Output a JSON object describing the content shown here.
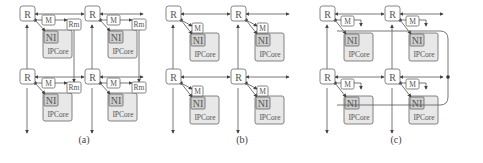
{
  "figure": {
    "panels": [
      {
        "id": "a",
        "caption": "(a)",
        "router_label": "R",
        "mesh": "2x2",
        "nodes": [
          {
            "router": "R",
            "modules": [
              "M",
              "Rm"
            ],
            "ni": "NI",
            "core": "IPCore"
          },
          {
            "router": "R",
            "modules": [
              "M",
              "Rm"
            ],
            "ni": "NI",
            "core": "IPCore"
          },
          {
            "router": "R",
            "modules": [
              "M",
              "Rm"
            ],
            "ni": "NI",
            "core": "IPCore"
          },
          {
            "router": "R",
            "modules": [
              "M",
              "Rm"
            ],
            "ni": "NI",
            "core": "IPCore"
          }
        ]
      },
      {
        "id": "b",
        "caption": "(b)",
        "router_label": "R",
        "mesh": "2x2",
        "nodes": [
          {
            "router": "R",
            "modules": [
              "M"
            ],
            "ni": "NI",
            "core": "IPCore"
          },
          {
            "router": "R",
            "modules": [
              "M"
            ],
            "ni": "NI",
            "core": "IPCore"
          },
          {
            "router": "R",
            "modules": [
              "M"
            ],
            "ni": "NI",
            "core": "IPCore"
          },
          {
            "router": "R",
            "modules": [
              "M"
            ],
            "ni": "NI",
            "core": "IPCore"
          }
        ]
      },
      {
        "id": "c",
        "caption": "(c)",
        "router_label": "R",
        "mesh": "2x2",
        "nodes": [
          {
            "router": "R",
            "modules": [
              "M"
            ],
            "ni": "NI",
            "core": "IPCore"
          },
          {
            "router": "R",
            "modules": [
              "M"
            ],
            "ni": "NI",
            "core": "IPCore"
          },
          {
            "router": "R",
            "modules": [
              "M"
            ],
            "ni": "NI",
            "core": "IPCore"
          },
          {
            "router": "R",
            "modules": [
              "M"
            ],
            "ni": "NI",
            "core": "IPCore"
          }
        ]
      }
    ],
    "labels": {
      "router": "R",
      "monitor": "M",
      "remote_monitor": "Rm",
      "ni": "NI",
      "core": "IPCore"
    },
    "colors": {
      "stroke": "#555555",
      "core_fill": "#e8e8e8",
      "ni_fill": "#cfcfcf",
      "box_fill": "#ffffff"
    }
  }
}
